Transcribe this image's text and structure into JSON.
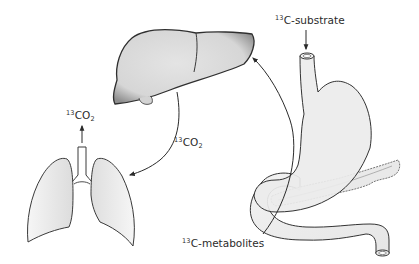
{
  "diagram": {
    "organs": [
      {
        "id": "liver",
        "name": "Liver"
      },
      {
        "id": "lungs",
        "name": "Lungs"
      },
      {
        "id": "stomach",
        "name": "Stomach"
      },
      {
        "id": "duodenum",
        "name": "Duodenum"
      },
      {
        "id": "pancreas",
        "name": "Pancreas"
      }
    ],
    "labels": {
      "substrate": {
        "isotope": "13",
        "text": "C-substrate"
      },
      "metabolites": {
        "isotope": "13",
        "text": "C-metabolites"
      },
      "co2_exhaled": {
        "isotope": "13",
        "text": "CO",
        "subscript": "2"
      },
      "co2_transport": {
        "isotope": "13",
        "text": "CO",
        "subscript": "2"
      }
    },
    "arrows": [
      {
        "from": "substrate-label",
        "to": "esophagus"
      },
      {
        "from": "gut",
        "to": "liver",
        "label": "13C-metabolites"
      },
      {
        "from": "liver",
        "to": "lungs",
        "label": "13CO2"
      },
      {
        "from": "lungs",
        "to": "exhaled-air",
        "label": "13CO2"
      }
    ],
    "colors": {
      "outline": "#3a3a3a",
      "liver_fill": "#d9d9d9",
      "organ_fill": "#ececec",
      "background": "#ffffff"
    }
  }
}
